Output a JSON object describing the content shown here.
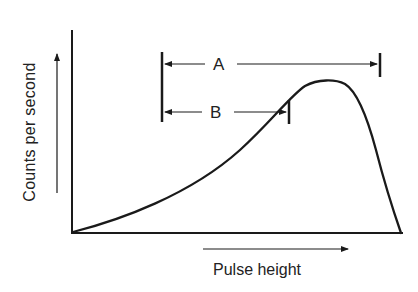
{
  "diagram": {
    "title": "",
    "x_axis_label": "Pulse height",
    "y_axis_label": "Counts per second",
    "annotations": [
      {
        "id": "A",
        "label": "A",
        "description": "Span from left marker to right marker near curve end"
      },
      {
        "id": "B",
        "label": "B",
        "description": "Span from left marker to marker near curve midpoint"
      }
    ],
    "curve": "Pulse-height distribution rising gradually to a broad peak then falling steeply",
    "colors": {
      "line": "#1a1a1a",
      "background": "#ffffff",
      "text": "#222222"
    }
  }
}
